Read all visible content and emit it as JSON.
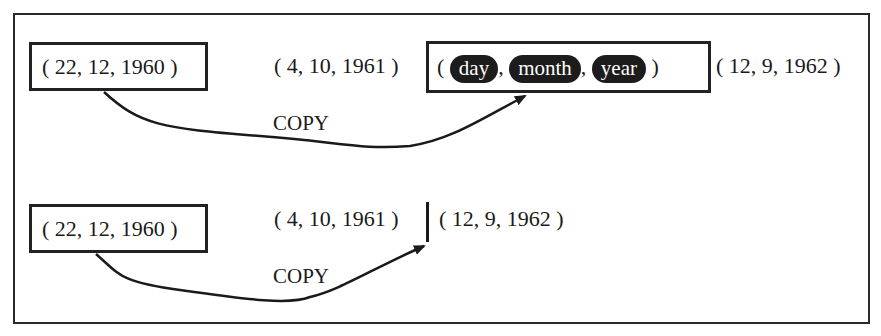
{
  "diagram": {
    "colors": {
      "ink": "#1a1a1a",
      "background": "#ffffff",
      "pill": "#1c1c1c",
      "pill_text": "#ffffff"
    },
    "top": {
      "source": "( 22, 12, 1960 )",
      "middle": "( 4, 10, 1961 )",
      "target": {
        "open": "(",
        "fields": [
          "day",
          "month",
          "year"
        ],
        "sep": ",",
        "close": ")"
      },
      "after": "( 12, 9, 1962 )",
      "arrow_label": "COPY"
    },
    "bottom": {
      "source": "( 22, 12, 1960 )",
      "middle": "( 4, 10, 1961 )",
      "after": "( 12, 9, 1962 )",
      "arrow_label": "COPY"
    }
  }
}
